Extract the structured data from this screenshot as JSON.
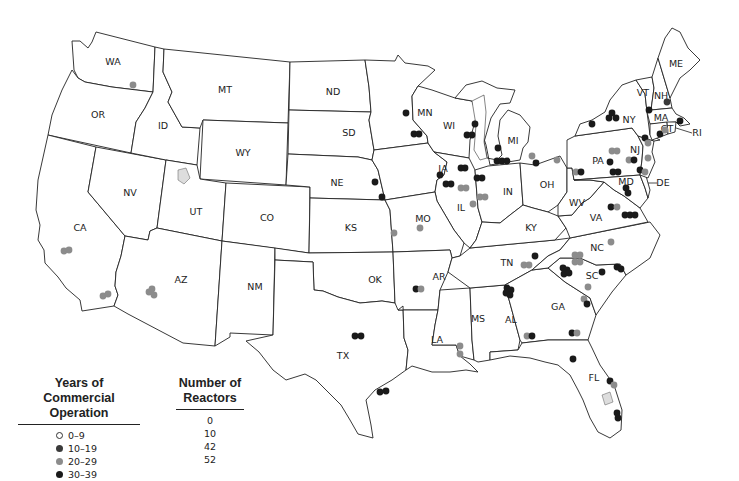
{
  "map": {
    "type": "choropleth-point-map",
    "subject": "U.S. commercial nuclear reactors by years of commercial operation",
    "state_labels": [
      {
        "abbr": "WA",
        "x": 113,
        "y": 62
      },
      {
        "abbr": "OR",
        "x": 98,
        "y": 115
      },
      {
        "abbr": "ID",
        "x": 163,
        "y": 126
      },
      {
        "abbr": "MT",
        "x": 225,
        "y": 90
      },
      {
        "abbr": "WY",
        "x": 243,
        "y": 153
      },
      {
        "abbr": "ND",
        "x": 333,
        "y": 92
      },
      {
        "abbr": "SD",
        "x": 349,
        "y": 133
      },
      {
        "abbr": "MN",
        "x": 425,
        "y": 113
      },
      {
        "abbr": "WI",
        "x": 449,
        "y": 126
      },
      {
        "abbr": "MI",
        "x": 513,
        "y": 141
      },
      {
        "abbr": "NY",
        "x": 629,
        "y": 120
      },
      {
        "abbr": "VT",
        "x": 643,
        "y": 93
      },
      {
        "abbr": "NH",
        "x": 661,
        "y": 96
      },
      {
        "abbr": "ME",
        "x": 676,
        "y": 64
      },
      {
        "abbr": "MA",
        "x": 661,
        "y": 118
      },
      {
        "abbr": "RI",
        "x": 697,
        "y": 133
      },
      {
        "abbr": "CT",
        "x": 667,
        "y": 129
      },
      {
        "abbr": "NJ",
        "x": 635,
        "y": 150
      },
      {
        "abbr": "PA",
        "x": 598,
        "y": 161
      },
      {
        "abbr": "DE",
        "x": 663,
        "y": 183
      },
      {
        "abbr": "MD",
        "x": 626,
        "y": 182
      },
      {
        "abbr": "NV",
        "x": 130,
        "y": 193
      },
      {
        "abbr": "UT",
        "x": 196,
        "y": 212
      },
      {
        "abbr": "CO",
        "x": 267,
        "y": 218
      },
      {
        "abbr": "NE",
        "x": 337,
        "y": 183
      },
      {
        "abbr": "IA",
        "x": 443,
        "y": 169
      },
      {
        "abbr": "IL",
        "x": 461,
        "y": 208
      },
      {
        "abbr": "IN",
        "x": 508,
        "y": 192
      },
      {
        "abbr": "OH",
        "x": 547,
        "y": 185
      },
      {
        "abbr": "WV",
        "x": 577,
        "y": 203
      },
      {
        "abbr": "VA",
        "x": 596,
        "y": 218
      },
      {
        "abbr": "KY",
        "x": 531,
        "y": 228
      },
      {
        "abbr": "KS",
        "x": 351,
        "y": 228
      },
      {
        "abbr": "MO",
        "x": 423,
        "y": 219
      },
      {
        "abbr": "CA",
        "x": 80,
        "y": 228
      },
      {
        "abbr": "AZ",
        "x": 181,
        "y": 280
      },
      {
        "abbr": "NM",
        "x": 255,
        "y": 287
      },
      {
        "abbr": "OK",
        "x": 375,
        "y": 280
      },
      {
        "abbr": "AR",
        "x": 439,
        "y": 277
      },
      {
        "abbr": "TN",
        "x": 507,
        "y": 263
      },
      {
        "abbr": "NC",
        "x": 597,
        "y": 248
      },
      {
        "abbr": "SC",
        "x": 592,
        "y": 276
      },
      {
        "abbr": "MS",
        "x": 478,
        "y": 319
      },
      {
        "abbr": "AL",
        "x": 511,
        "y": 320
      },
      {
        "abbr": "GA",
        "x": 558,
        "y": 307
      },
      {
        "abbr": "LA",
        "x": 437,
        "y": 340
      },
      {
        "abbr": "TX",
        "x": 343,
        "y": 356
      },
      {
        "abbr": "FL",
        "x": 594,
        "y": 378
      }
    ],
    "reactors": [
      {
        "x": 133,
        "y": 85,
        "cat": "20-29"
      },
      {
        "x": 64,
        "y": 251,
        "cat": "20-29"
      },
      {
        "x": 69,
        "y": 250,
        "cat": "20-29"
      },
      {
        "x": 103,
        "y": 296,
        "cat": "20-29"
      },
      {
        "x": 108,
        "y": 294,
        "cat": "20-29"
      },
      {
        "x": 149,
        "y": 292,
        "cat": "20-29"
      },
      {
        "x": 152,
        "y": 289,
        "cat": "20-29"
      },
      {
        "x": 154,
        "y": 295,
        "cat": "20-29"
      },
      {
        "x": 406,
        "y": 113,
        "cat": "30-39"
      },
      {
        "x": 414,
        "y": 134,
        "cat": "30-39"
      },
      {
        "x": 419,
        "y": 134,
        "cat": "30-39"
      },
      {
        "x": 375,
        "y": 182,
        "cat": "30-39"
      },
      {
        "x": 382,
        "y": 197,
        "cat": "30-39"
      },
      {
        "x": 394,
        "y": 233,
        "cat": "20-29"
      },
      {
        "x": 440,
        "y": 175,
        "cat": "30-39"
      },
      {
        "x": 475,
        "y": 124,
        "cat": "30-39"
      },
      {
        "x": 467,
        "y": 135,
        "cat": "30-39"
      },
      {
        "x": 472,
        "y": 135,
        "cat": "30-39"
      },
      {
        "x": 498,
        "y": 148,
        "cat": "30-39"
      },
      {
        "x": 497,
        "y": 161,
        "cat": "30-39"
      },
      {
        "x": 502,
        "y": 161,
        "cat": "30-39"
      },
      {
        "x": 507,
        "y": 161,
        "cat": "30-39"
      },
      {
        "x": 532,
        "y": 156,
        "cat": "20-29"
      },
      {
        "x": 536,
        "y": 163,
        "cat": "30-39"
      },
      {
        "x": 557,
        "y": 160,
        "cat": "20-29"
      },
      {
        "x": 461,
        "y": 168,
        "cat": "30-39"
      },
      {
        "x": 465,
        "y": 168,
        "cat": "30-39"
      },
      {
        "x": 477,
        "y": 178,
        "cat": "30-39"
      },
      {
        "x": 482,
        "y": 178,
        "cat": "30-39"
      },
      {
        "x": 446,
        "y": 184,
        "cat": "30-39"
      },
      {
        "x": 451,
        "y": 184,
        "cat": "30-39"
      },
      {
        "x": 461,
        "y": 188,
        "cat": "20-29"
      },
      {
        "x": 466,
        "y": 188,
        "cat": "20-29"
      },
      {
        "x": 480,
        "y": 197,
        "cat": "20-29"
      },
      {
        "x": 485,
        "y": 197,
        "cat": "20-29"
      },
      {
        "x": 473,
        "y": 204,
        "cat": "20-29"
      },
      {
        "x": 420,
        "y": 228,
        "cat": "20-29"
      },
      {
        "x": 576,
        "y": 172,
        "cat": "20-29"
      },
      {
        "x": 581,
        "y": 172,
        "cat": "30-39"
      },
      {
        "x": 592,
        "y": 124,
        "cat": "30-39"
      },
      {
        "x": 609,
        "y": 118,
        "cat": "30-39"
      },
      {
        "x": 612,
        "y": 113,
        "cat": "30-39"
      },
      {
        "x": 616,
        "y": 118,
        "cat": "30-39"
      },
      {
        "x": 649,
        "y": 110,
        "cat": "30-39"
      },
      {
        "x": 667,
        "y": 102,
        "cat": "10-19"
      },
      {
        "x": 680,
        "y": 121,
        "cat": "30-39"
      },
      {
        "x": 660,
        "y": 134,
        "cat": "30-39"
      },
      {
        "x": 665,
        "y": 130,
        "cat": "20-29"
      },
      {
        "x": 645,
        "y": 138,
        "cat": "30-39"
      },
      {
        "x": 648,
        "y": 143,
        "cat": "20-29"
      },
      {
        "x": 612,
        "y": 151,
        "cat": "20-29"
      },
      {
        "x": 617,
        "y": 151,
        "cat": "20-29"
      },
      {
        "x": 610,
        "y": 162,
        "cat": "30-39"
      },
      {
        "x": 629,
        "y": 160,
        "cat": "20-29"
      },
      {
        "x": 634,
        "y": 160,
        "cat": "30-39"
      },
      {
        "x": 648,
        "y": 158,
        "cat": "20-29"
      },
      {
        "x": 613,
        "y": 172,
        "cat": "30-39"
      },
      {
        "x": 618,
        "y": 172,
        "cat": "30-39"
      },
      {
        "x": 640,
        "y": 170,
        "cat": "30-39"
      },
      {
        "x": 645,
        "y": 172,
        "cat": "20-29"
      },
      {
        "x": 626,
        "y": 188,
        "cat": "30-39"
      },
      {
        "x": 628,
        "y": 193,
        "cat": "30-39"
      },
      {
        "x": 611,
        "y": 207,
        "cat": "30-39"
      },
      {
        "x": 617,
        "y": 207,
        "cat": "20-29"
      },
      {
        "x": 625,
        "y": 215,
        "cat": "30-39"
      },
      {
        "x": 630,
        "y": 215,
        "cat": "30-39"
      },
      {
        "x": 635,
        "y": 215,
        "cat": "30-39"
      },
      {
        "x": 611,
        "y": 242,
        "cat": "20-29"
      },
      {
        "x": 575,
        "y": 255,
        "cat": "20-29"
      },
      {
        "x": 580,
        "y": 255,
        "cat": "20-29"
      },
      {
        "x": 575,
        "y": 262,
        "cat": "20-29"
      },
      {
        "x": 580,
        "y": 262,
        "cat": "20-29"
      },
      {
        "x": 563,
        "y": 268,
        "cat": "30-39"
      },
      {
        "x": 567,
        "y": 270,
        "cat": "30-39"
      },
      {
        "x": 564,
        "y": 274,
        "cat": "30-39"
      },
      {
        "x": 569,
        "y": 273,
        "cat": "30-39"
      },
      {
        "x": 602,
        "y": 272,
        "cat": "30-39"
      },
      {
        "x": 617,
        "y": 267,
        "cat": "30-39"
      },
      {
        "x": 621,
        "y": 269,
        "cat": "30-39"
      },
      {
        "x": 588,
        "y": 287,
        "cat": "20-29"
      },
      {
        "x": 584,
        "y": 299,
        "cat": "20-29"
      },
      {
        "x": 587,
        "y": 304,
        "cat": "30-39"
      },
      {
        "x": 535,
        "y": 256,
        "cat": "30-39"
      },
      {
        "x": 524,
        "y": 265,
        "cat": "20-29"
      },
      {
        "x": 529,
        "y": 265,
        "cat": "20-29"
      },
      {
        "x": 507,
        "y": 288,
        "cat": "30-39"
      },
      {
        "x": 511,
        "y": 290,
        "cat": "30-39"
      },
      {
        "x": 506,
        "y": 293,
        "cat": "30-39"
      },
      {
        "x": 510,
        "y": 295,
        "cat": "30-39"
      },
      {
        "x": 527,
        "y": 336,
        "cat": "20-29"
      },
      {
        "x": 532,
        "y": 336,
        "cat": "30-39"
      },
      {
        "x": 572,
        "y": 333,
        "cat": "30-39"
      },
      {
        "x": 577,
        "y": 333,
        "cat": "20-29"
      },
      {
        "x": 573,
        "y": 359,
        "cat": "30-39"
      },
      {
        "x": 416,
        "y": 289,
        "cat": "30-39"
      },
      {
        "x": 421,
        "y": 289,
        "cat": "20-29"
      },
      {
        "x": 460,
        "y": 346,
        "cat": "20-29"
      },
      {
        "x": 460,
        "y": 354,
        "cat": "20-29"
      },
      {
        "x": 355,
        "y": 336,
        "cat": "30-39"
      },
      {
        "x": 361,
        "y": 336,
        "cat": "30-39"
      },
      {
        "x": 380,
        "y": 392,
        "cat": "30-39"
      },
      {
        "x": 386,
        "y": 391,
        "cat": "30-39"
      },
      {
        "x": 610,
        "y": 381,
        "cat": "30-39"
      },
      {
        "x": 614,
        "y": 385,
        "cat": "20-29"
      },
      {
        "x": 617,
        "y": 413,
        "cat": "30-39"
      },
      {
        "x": 618,
        "y": 418,
        "cat": "30-39"
      }
    ]
  },
  "colors": {
    "0-9": "#ffffff",
    "10-19": "#3a3a3a",
    "20-29": "#8c8c8c",
    "30-39": "#1a1a1a"
  },
  "legend": {
    "years_header_line1": "Years of Commercial",
    "years_header_line2": "Operation",
    "count_header_line1": "Number of",
    "count_header_line2": "Reactors",
    "rows": [
      {
        "range": "0–9",
        "count": "0",
        "key": "0-9"
      },
      {
        "range": "10–19",
        "count": "10",
        "key": "10-19"
      },
      {
        "range": "20–29",
        "count": "42",
        "key": "20-29"
      },
      {
        "range": "30–39",
        "count": "52",
        "key": "30-39"
      }
    ]
  }
}
